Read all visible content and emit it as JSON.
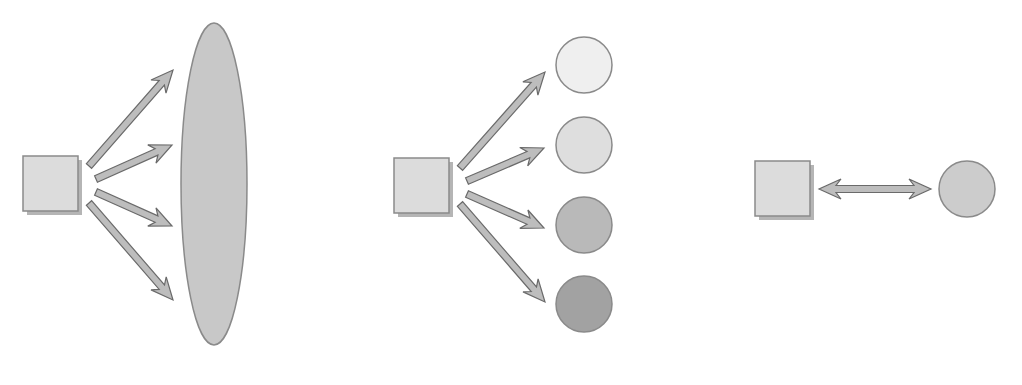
{
  "diagram": {
    "title": "",
    "panels": [
      {
        "id": "broadcast",
        "source": {
          "shape": "square",
          "x": 23,
          "y": 156,
          "w": 55,
          "h": 55,
          "fill": "#dcdcdc"
        },
        "target": {
          "shape": "ellipse",
          "cx": 214,
          "cy": 184,
          "rx": 33,
          "ry": 161,
          "fill": "#c8c8c8"
        },
        "arrows": [
          {
            "x1": 89,
            "y1": 166,
            "x2": 173,
            "y2": 70
          },
          {
            "x1": 96,
            "y1": 179,
            "x2": 172,
            "y2": 145
          },
          {
            "x1": 96,
            "y1": 192,
            "x2": 172,
            "y2": 226
          },
          {
            "x1": 89,
            "y1": 203,
            "x2": 173,
            "y2": 300
          }
        ]
      },
      {
        "id": "multicast",
        "source": {
          "shape": "square",
          "x": 394,
          "y": 158,
          "w": 55,
          "h": 55,
          "fill": "#dcdcdc"
        },
        "targets": [
          {
            "shape": "circle",
            "cx": 584,
            "cy": 65,
            "r": 28,
            "fill": "#efefef"
          },
          {
            "shape": "circle",
            "cx": 584,
            "cy": 145,
            "r": 28,
            "fill": "#dedede"
          },
          {
            "shape": "circle",
            "cx": 584,
            "cy": 225,
            "r": 28,
            "fill": "#b9b9b9"
          },
          {
            "shape": "circle",
            "cx": 584,
            "cy": 304,
            "r": 28,
            "fill": "#a2a2a2"
          }
        ],
        "arrows": [
          {
            "x1": 460,
            "y1": 168,
            "x2": 545,
            "y2": 72
          },
          {
            "x1": 467,
            "y1": 181,
            "x2": 544,
            "y2": 148
          },
          {
            "x1": 467,
            "y1": 194,
            "x2": 544,
            "y2": 228
          },
          {
            "x1": 460,
            "y1": 204,
            "x2": 545,
            "y2": 302
          }
        ]
      },
      {
        "id": "unicast",
        "source": {
          "shape": "square",
          "x": 755,
          "y": 161,
          "w": 55,
          "h": 55,
          "fill": "#dcdcdc"
        },
        "target": {
          "shape": "circle",
          "cx": 967,
          "cy": 189,
          "r": 28,
          "fill": "#cccccc"
        },
        "arrows": [
          {
            "x1": 819,
            "y1": 189,
            "x2": 931,
            "y2": 189,
            "double": true
          }
        ]
      }
    ],
    "colors": {
      "stroke": "#8a8a8a",
      "arrow_fill": "#bdbdbd",
      "arrow_stroke": "#6a6a6a",
      "shadow": "#b5b5b5"
    }
  }
}
